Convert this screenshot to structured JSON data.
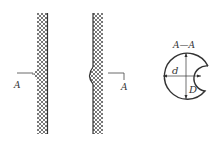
{
  "diagram": {
    "type": "engineering-section-drawing",
    "section_marker_left": "A",
    "section_marker_right": "A",
    "section_title": "A—A",
    "dimension_inner": "d",
    "dimension_outer": "D",
    "colors": {
      "line": "#333333",
      "hatch": "#555555",
      "background": "#ffffff"
    }
  }
}
